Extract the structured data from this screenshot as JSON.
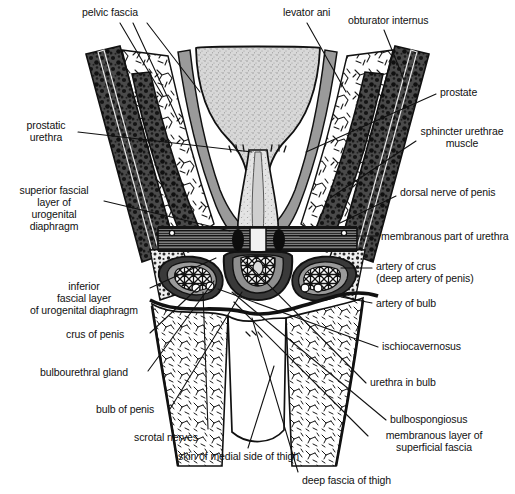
{
  "figure": {
    "width": 515,
    "height": 494,
    "background": "#ffffff",
    "ink": "#111111",
    "palette": {
      "outline": "#111111",
      "muscle_dark": "#3a3a3a",
      "fascia_grey": "#9a9a9a",
      "bladder_stipple": "#b8b8b8",
      "prostate_stipple": "#c9c9c9",
      "fat_white": "#ffffff",
      "diaphragm_band": "#6e6e6e"
    }
  },
  "labels": [
    {
      "id": "pelvic-fascia",
      "text": "pelvic fascia",
      "x": 82,
      "y": 10,
      "align": "left"
    },
    {
      "id": "levator-ani",
      "text": "levator ani",
      "x": 283,
      "y": 10,
      "align": "left"
    },
    {
      "id": "obturator-internus",
      "text": "obturator internus",
      "x": 348,
      "y": 16,
      "align": "left"
    },
    {
      "id": "prostate",
      "text": "prostate",
      "x": 440,
      "y": 88,
      "align": "left"
    },
    {
      "id": "prostatic-urethra",
      "text": "prostatic\nurethra",
      "x": 14,
      "y": 121,
      "align": "left"
    },
    {
      "id": "sphincter-urethrae-muscle",
      "text": "sphincter urethrae\nmuscle",
      "x": 420,
      "y": 127,
      "align": "left"
    },
    {
      "id": "superior-fascial-layer",
      "text": "superior fascial\nlayer of\nurogenital\ndiaphragm",
      "x": 12,
      "y": 186,
      "align": "left"
    },
    {
      "id": "dorsal-nerve-of-penis",
      "text": "dorsal nerve of penis",
      "x": 400,
      "y": 188,
      "align": "left"
    },
    {
      "id": "membranous-part-of-urethra",
      "text": "membranous part of urethra",
      "x": 381,
      "y": 230,
      "align": "left"
    },
    {
      "id": "artery-of-crus",
      "text": "artery of crus\n(deep artery of penis)",
      "x": 376,
      "y": 262,
      "align": "left"
    },
    {
      "id": "inferior-fascial-layer",
      "text": "inferior\nfascial layer\nof urogenital diaphragm",
      "x": 16,
      "y": 282,
      "align": "left"
    },
    {
      "id": "artery-of-bulb",
      "text": "artery of bulb",
      "x": 376,
      "y": 299,
      "align": "left"
    },
    {
      "id": "crus-of-penis",
      "text": "crus of penis",
      "x": 66,
      "y": 330,
      "align": "left"
    },
    {
      "id": "ischiocavernosus",
      "text": "ischiocavernosus",
      "x": 382,
      "y": 342,
      "align": "left"
    },
    {
      "id": "bulbourethral-gland",
      "text": "bulbourethral gland",
      "x": 40,
      "y": 368,
      "align": "left"
    },
    {
      "id": "urethra-in-bulb",
      "text": "urethra in bulb",
      "x": 370,
      "y": 378,
      "align": "left"
    },
    {
      "id": "bulb-of-penis",
      "text": "bulb of penis",
      "x": 96,
      "y": 405,
      "align": "left"
    },
    {
      "id": "bulbospongiosus",
      "text": "bulbospongiosus",
      "x": 390,
      "y": 415,
      "align": "left"
    },
    {
      "id": "scrotal-nerves",
      "text": "scrotal nerves",
      "x": 134,
      "y": 433,
      "align": "left"
    },
    {
      "id": "membranous-layer-superficial-fascia",
      "text": "membranous layer of\nsuperficial fascia",
      "x": 372,
      "y": 431,
      "align": "left"
    },
    {
      "id": "skin-of-medial-side-of-thigh",
      "text": "skin of medial side of thigh",
      "x": 178,
      "y": 452,
      "align": "left"
    },
    {
      "id": "deep-fascia-of-thigh",
      "text": "deep fascia of thigh",
      "x": 302,
      "y": 476,
      "align": "left"
    }
  ],
  "leader_lines": [
    {
      "id": "pelvic-fascia-a",
      "points": "120,23 163,96"
    },
    {
      "id": "pelvic-fascia-b",
      "points": "133,23 178,120"
    },
    {
      "id": "pelvic-fascia-c",
      "points": "146,23 196,86"
    },
    {
      "id": "levator-ani",
      "points": "307,23 344,90"
    },
    {
      "id": "obturator-internus",
      "points": "382,30 402,80"
    },
    {
      "id": "prostate",
      "points": "437,94 306,150"
    },
    {
      "id": "prostatic-urethra",
      "points": "78,132 252,150"
    },
    {
      "id": "sphincter-urethrae",
      "points": "417,140 330,196"
    },
    {
      "id": "superior-fascial",
      "points": "104,200 228,232"
    },
    {
      "id": "dorsal-nerve",
      "points": "397,196 340,222"
    },
    {
      "id": "membranous-urethra",
      "points": "378,237 298,237"
    },
    {
      "id": "artery-of-crus",
      "points": "372,268 340,268"
    },
    {
      "id": "artery-of-bulb",
      "points": "372,303 340,303"
    },
    {
      "id": "inferior-fascial",
      "points": "148,288 215,258"
    },
    {
      "id": "crus-of-penis",
      "points": "150,332 236,268"
    },
    {
      "id": "ischiocavernosus",
      "points": "378,348 216,288"
    },
    {
      "id": "bulbourethral-gland",
      "points": "148,370 214,280"
    },
    {
      "id": "urethra-in-bulb",
      "points": "366,384 244,262"
    },
    {
      "id": "bulb-of-penis",
      "points": "170,408 240,290"
    },
    {
      "id": "bulbospongiosus",
      "points": "386,420 230,290"
    },
    {
      "id": "scrotal-nerves",
      "points": "206,430 202,290"
    },
    {
      "id": "memb-layer-fascia",
      "points": "368,437 232,300"
    },
    {
      "id": "skin-of-medial-thigh",
      "points": "248,448 272,368"
    },
    {
      "id": "deep-fascia-of-thigh",
      "points": "298,472 250,318"
    }
  ],
  "structures": [
    {
      "id": "bladder",
      "name": "urinary bladder",
      "fill": "stipple-grey"
    },
    {
      "id": "prostate-body",
      "name": "prostate",
      "fill": "stipple-grey"
    },
    {
      "id": "obturator-internus-left",
      "name": "obturator internus (left)",
      "fill": "muscle-dark"
    },
    {
      "id": "obturator-internus-right",
      "name": "obturator internus (right)",
      "fill": "muscle-dark"
    },
    {
      "id": "levator-ani-left",
      "name": "levator ani (left)",
      "fill": "muscle-dark"
    },
    {
      "id": "levator-ani-right",
      "name": "levator ani (right)",
      "fill": "muscle-dark"
    },
    {
      "id": "pelvic-fascia-left",
      "name": "pelvic fascia (left)",
      "fill": "fascia-grey"
    },
    {
      "id": "pelvic-fascia-right",
      "name": "pelvic fascia (right)",
      "fill": "fascia-grey"
    },
    {
      "id": "urogenital-diaphragm",
      "name": "urogenital diaphragm",
      "fill": "striated-band"
    },
    {
      "id": "crus-left",
      "name": "crus of penis (left)",
      "fill": "corpus"
    },
    {
      "id": "crus-right",
      "name": "crus of penis (right)",
      "fill": "corpus"
    },
    {
      "id": "bulb",
      "name": "bulb of penis",
      "fill": "corpus"
    },
    {
      "id": "thigh-left",
      "name": "thigh (left)",
      "fill": "fat-hatch"
    },
    {
      "id": "thigh-right",
      "name": "thigh (right)",
      "fill": "fat-hatch"
    },
    {
      "id": "scrotum",
      "name": "scrotum / medial thigh skin",
      "fill": "fat-hatch"
    }
  ]
}
